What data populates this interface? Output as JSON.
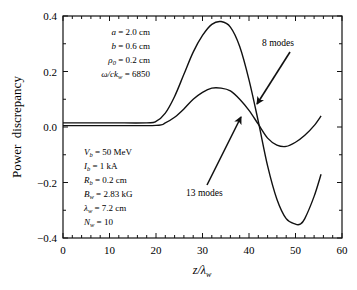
{
  "chart_data": {
    "type": "line",
    "title": "",
    "xlabel": "z/λw",
    "ylabel": "Power  discrepancy",
    "xlim": [
      0,
      60
    ],
    "ylim": [
      -0.4,
      0.4
    ],
    "x_ticks": [
      0,
      10,
      20,
      30,
      40,
      50,
      60
    ],
    "x_tick_labels": [
      "0",
      "10",
      "20",
      "30",
      "40",
      "50",
      "60"
    ],
    "y_ticks": [
      0.4,
      0.2,
      0.0,
      -0.2,
      -0.4
    ],
    "y_tick_labels": [
      "0.4",
      "0.2",
      "0.0",
      "−0.2",
      "−0.4"
    ],
    "grid": false,
    "legend": null,
    "series": [
      {
        "name": "8 modes",
        "x": [
          0,
          10,
          18,
          20,
          22,
          24,
          26,
          28,
          30,
          32,
          34,
          36,
          38,
          40,
          42,
          44,
          46,
          48,
          50,
          51,
          52,
          54,
          55.5
        ],
        "values": [
          0.015,
          0.015,
          0.015,
          0.02,
          0.05,
          0.11,
          0.19,
          0.27,
          0.33,
          0.37,
          0.38,
          0.36,
          0.29,
          0.17,
          0.02,
          -0.14,
          -0.26,
          -0.33,
          -0.35,
          -0.35,
          -0.33,
          -0.25,
          -0.17
        ]
      },
      {
        "name": "13 modes",
        "x": [
          0,
          10,
          20,
          22,
          24,
          26,
          28,
          30,
          32,
          34,
          36,
          38,
          40,
          42,
          44,
          46,
          48,
          50,
          52,
          54,
          55.5
        ],
        "values": [
          0.005,
          0.005,
          0.006,
          0.015,
          0.035,
          0.065,
          0.1,
          0.125,
          0.14,
          0.14,
          0.13,
          0.1,
          0.06,
          0.01,
          -0.04,
          -0.065,
          -0.07,
          -0.055,
          -0.03,
          0.005,
          0.04
        ]
      }
    ],
    "annotations": [
      {
        "text": "8 modes",
        "arrow_to": [
          41.5,
          0.075
        ]
      },
      {
        "text": "13 modes",
        "arrow_to": [
          38.5,
          0.09
        ]
      }
    ],
    "parameters_top": [
      "a = 2.0 cm",
      "b = 0.6 cm",
      "ρ0 = 0.2 cm",
      "ω/ckw = 6850"
    ],
    "parameters_bottom": [
      "Vb = 50 MeV",
      "Ib = 1 kA",
      "Rb = 0.2 cm",
      "Bw = 2.83 kG",
      "λw = 7.2 cm",
      "Nw = 10"
    ]
  },
  "labels": {
    "ylabel": "Power  discrepancy",
    "xlabel": "z/λw",
    "annot_8": "8 modes",
    "annot_13": "13 modes"
  },
  "params_top": [
    {
      "sym": "a",
      "sub": "",
      "rest": " = 2.0 cm"
    },
    {
      "sym": "b",
      "sub": "",
      "rest": " = 0.6 cm"
    },
    {
      "sym": "ρ",
      "sub": "0",
      "rest": " = 0.2 cm"
    },
    {
      "sym": "ω/ck",
      "sub": "w",
      "rest": " = 6850"
    }
  ],
  "params_bottom": [
    {
      "sym": "V",
      "sub": "b",
      "rest": " = 50 MeV"
    },
    {
      "sym": "I",
      "sub": "b",
      "rest": " = 1 kA"
    },
    {
      "sym": "R",
      "sub": "b",
      "rest": " = 0.2 cm"
    },
    {
      "sym": "B",
      "sub": "w",
      "rest": " = 2.83 kG"
    },
    {
      "sym": "λ",
      "sub": "w",
      "rest": " = 7.2 cm"
    },
    {
      "sym": "N",
      "sub": "w",
      "rest": " = 10"
    }
  ]
}
